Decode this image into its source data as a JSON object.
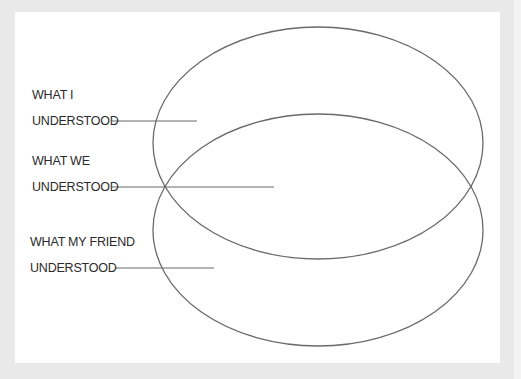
{
  "diagram": {
    "type": "venn",
    "colors": {
      "background": "#e9e9e9",
      "panel": "#ffffff",
      "stroke": "#6a6a6a",
      "text": "#2a2a2a"
    },
    "ellipses": [
      {
        "name": "top-ellipse",
        "cx": 318,
        "cy": 143,
        "rx": 165,
        "ry": 116
      },
      {
        "name": "bottom-ellipse",
        "cx": 318,
        "cy": 230,
        "rx": 165,
        "ry": 116
      }
    ],
    "labels": [
      {
        "line1": "WHAT I",
        "line2": "UNDERSTOOD",
        "leader": {
          "x1": 112,
          "x2": 197,
          "y": 121
        }
      },
      {
        "line1": "WHAT WE",
        "line2": "UNDERSTOOD",
        "leader": {
          "x1": 112,
          "x2": 274,
          "y": 187
        }
      },
      {
        "line1": "WHAT MY FRIEND",
        "line2": "UNDERSTOOD",
        "leader": {
          "x1": 115,
          "x2": 214,
          "y": 268
        }
      }
    ]
  }
}
